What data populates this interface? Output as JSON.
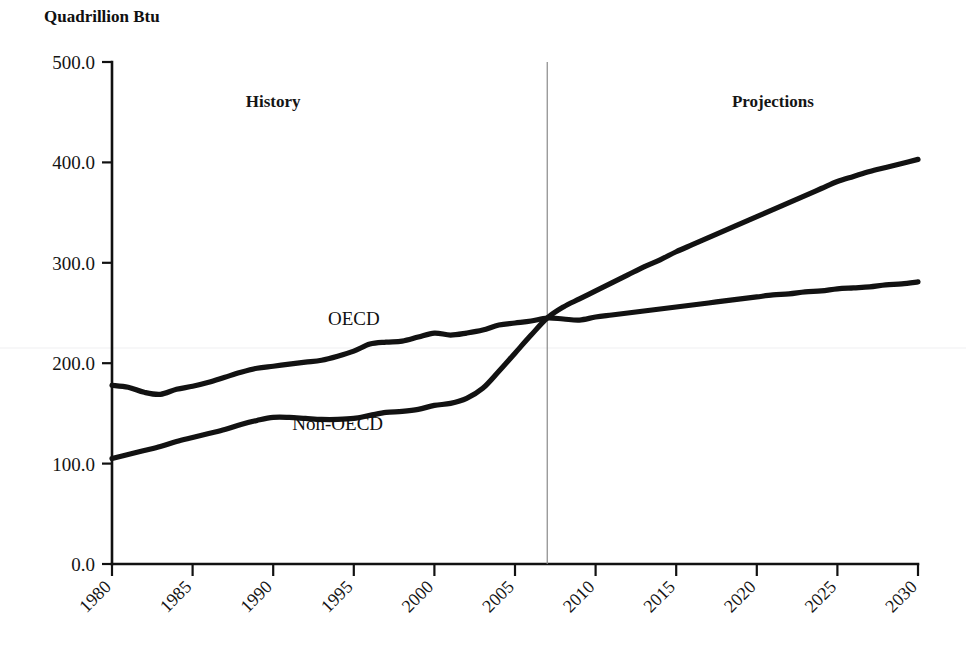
{
  "figure": {
    "title": "Quadrillion Btu",
    "background_color": "#ffffff",
    "line_color": "#121212",
    "divider_color": "#8a8a8a"
  },
  "annotations": {
    "history_label": "History",
    "projections_label": "Projections",
    "divider_year": 2007,
    "oecd_label": "OECD",
    "non_oecd_label": "Non-OECD"
  },
  "ticks": {
    "y": [
      "0.0",
      "100.0",
      "200.0",
      "300.0",
      "400.0",
      "500.0"
    ],
    "x": [
      "1980",
      "1985",
      "1990",
      "1995",
      "2000",
      "2005",
      "2010",
      "2015",
      "2020",
      "2025",
      "2030"
    ]
  },
  "chart_data": {
    "type": "line",
    "title": "Quadrillion Btu",
    "xlabel": "",
    "ylabel": "Quadrillion Btu",
    "xlim": [
      1980,
      2030
    ],
    "ylim": [
      0,
      500
    ],
    "ytick_values": [
      0,
      100,
      200,
      300,
      400,
      500
    ],
    "xtick_values": [
      1980,
      1985,
      1990,
      1995,
      2000,
      2005,
      2010,
      2015,
      2020,
      2025,
      2030
    ],
    "grid": false,
    "legend": "inline-labels",
    "annotations": [
      {
        "text": "History",
        "x": 1990,
        "y": 455
      },
      {
        "text": "Projections",
        "x": 2021,
        "y": 455
      },
      {
        "text": "OECD",
        "x": 1995,
        "y": 238
      },
      {
        "text": "Non-OECD",
        "x": 1994,
        "y": 133
      }
    ],
    "vertical_divider": {
      "x": 2007,
      "label": "history/projection split"
    },
    "x": [
      1980,
      1981,
      1982,
      1983,
      1984,
      1985,
      1986,
      1987,
      1988,
      1989,
      1990,
      1991,
      1992,
      1993,
      1994,
      1995,
      1996,
      1997,
      1998,
      1999,
      2000,
      2001,
      2002,
      2003,
      2004,
      2005,
      2006,
      2007,
      2008,
      2009,
      2010,
      2011,
      2012,
      2013,
      2014,
      2015,
      2016,
      2017,
      2018,
      2019,
      2020,
      2021,
      2022,
      2023,
      2024,
      2025,
      2026,
      2027,
      2028,
      2029,
      2030
    ],
    "series": [
      {
        "name": "OECD",
        "values": [
          178,
          176,
          171,
          169,
          174,
          177,
          181,
          186,
          191,
          195,
          197,
          199,
          201,
          203,
          207,
          212,
          219,
          221,
          222,
          226,
          230,
          228,
          230,
          233,
          238,
          240,
          242,
          245,
          244,
          243,
          246,
          248,
          250,
          252,
          254,
          256,
          258,
          260,
          262,
          264,
          266,
          268,
          269,
          271,
          272,
          274,
          275,
          276,
          278,
          279,
          281
        ]
      },
      {
        "name": "Non-OECD",
        "values": [
          105,
          109,
          113,
          117,
          122,
          126,
          130,
          134,
          139,
          143,
          146,
          146,
          145,
          144,
          144,
          145,
          148,
          151,
          152,
          154,
          158,
          160,
          165,
          175,
          192,
          210,
          228,
          245,
          256,
          264,
          272,
          280,
          288,
          296,
          303,
          311,
          318,
          325,
          332,
          339,
          346,
          353,
          360,
          367,
          374,
          381,
          386,
          391,
          395,
          399,
          403
        ]
      }
    ]
  }
}
